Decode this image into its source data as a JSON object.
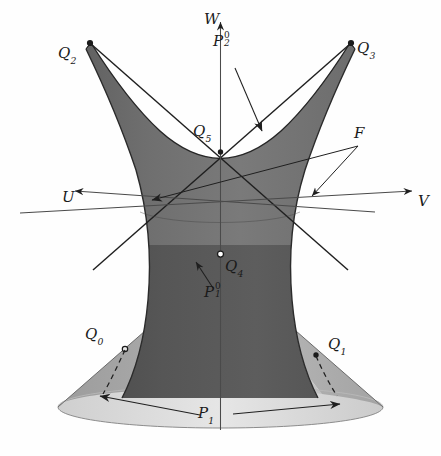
{
  "figure": {
    "type": "3d-geometry-diagram",
    "background_color": "#fefefe",
    "ink_color": "#1a1a1a"
  },
  "axes": {
    "u": {
      "label": "U",
      "direction": "left"
    },
    "v": {
      "label": "V",
      "direction": "right"
    },
    "w": {
      "label": "W",
      "direction": "up"
    }
  },
  "surfaces": {
    "hyperboloid": {
      "label": "F",
      "fill_upper": "#6e6e6e",
      "fill_lower": "#4f4f4f",
      "edge_color": "#2a2a2a"
    },
    "cone": {
      "fill_left": "#a6a6a6",
      "fill_center": "#c8c8c8",
      "fill_right": "#b4b4b4",
      "base_fill": "#dcdcdc"
    }
  },
  "points": {
    "q0": {
      "label": "Q",
      "sub": "0",
      "marker": "open-circle"
    },
    "q1": {
      "label": "Q",
      "sub": "1",
      "marker": "filled-dot"
    },
    "q2": {
      "label": "Q",
      "sub": "2",
      "marker": "filled-dot"
    },
    "q3": {
      "label": "Q",
      "sub": "3",
      "marker": "filled-dot"
    },
    "q4": {
      "label": "Q",
      "sub": "4",
      "marker": "open-circle"
    },
    "q5": {
      "label": "Q",
      "sub": "5",
      "marker": "filled-dot"
    }
  },
  "annotations": {
    "p2_upper": {
      "base": "P",
      "sup": "0",
      "sub": "2"
    },
    "p1_upper": {
      "base": "P",
      "sup": "0",
      "sub": "1"
    },
    "p1_base": {
      "base": "P",
      "sup": "",
      "sub": "1"
    },
    "family": {
      "label": "F"
    }
  }
}
